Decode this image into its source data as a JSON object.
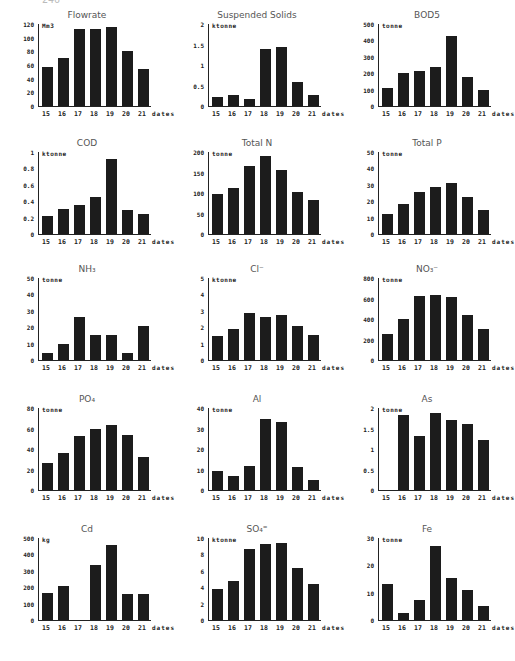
{
  "page_number": "246",
  "chart_data": [
    {
      "type": "bar",
      "title": "Flowrate",
      "unit": "Mm3",
      "xlabel": "dates",
      "categories": [
        "15",
        "16",
        "17",
        "18",
        "19",
        "20",
        "21"
      ],
      "values": [
        57,
        70,
        112,
        113,
        115,
        81,
        54
      ],
      "yticks": [
        "0",
        "20",
        "40",
        "60",
        "80",
        "100",
        "120"
      ],
      "ylim": [
        0,
        120
      ]
    },
    {
      "type": "bar",
      "title": "Suspended Solids",
      "unit": "ktonne",
      "xlabel": "dates",
      "categories": [
        "15",
        "16",
        "17",
        "18",
        "19",
        "20",
        "21"
      ],
      "values": [
        0.22,
        0.28,
        0.17,
        1.4,
        1.45,
        0.58,
        0.26
      ],
      "yticks": [
        "0",
        "0.5",
        "1",
        "1.5",
        "2"
      ],
      "ylim": [
        0,
        2
      ]
    },
    {
      "type": "bar",
      "title": "BOD5",
      "unit": "tonne",
      "xlabel": "dates",
      "categories": [
        "15",
        "16",
        "17",
        "18",
        "19",
        "20",
        "21"
      ],
      "values": [
        110,
        200,
        215,
        240,
        425,
        175,
        100
      ],
      "yticks": [
        "0",
        "100",
        "200",
        "300",
        "400",
        "500"
      ],
      "ylim": [
        0,
        500
      ]
    },
    {
      "type": "bar",
      "title": "COD",
      "unit": "ktonne",
      "xlabel": "dates",
      "categories": [
        "15",
        "16",
        "17",
        "18",
        "19",
        "20",
        "21"
      ],
      "values": [
        0.22,
        0.3,
        0.35,
        0.45,
        0.92,
        0.29,
        0.25
      ],
      "yticks": [
        "0",
        "0.2",
        "0.4",
        "0.6",
        "0.8",
        "1"
      ],
      "ylim": [
        0,
        1
      ]
    },
    {
      "type": "bar",
      "title": "Total N",
      "unit": "tonne",
      "xlabel": "dates",
      "categories": [
        "15",
        "16",
        "17",
        "18",
        "19",
        "20",
        "21"
      ],
      "values": [
        97,
        113,
        165,
        190,
        155,
        102,
        82
      ],
      "yticks": [
        "0",
        "50",
        "100",
        "150",
        "200"
      ],
      "ylim": [
        0,
        200
      ]
    },
    {
      "type": "bar",
      "title": "Total P",
      "unit": "tonne",
      "xlabel": "dates",
      "categories": [
        "15",
        "16",
        "17",
        "18",
        "19",
        "20",
        "21"
      ],
      "values": [
        12.5,
        18,
        25.5,
        28.5,
        31,
        22.5,
        14.5
      ],
      "yticks": [
        "0",
        "10",
        "20",
        "30",
        "40",
        "50"
      ],
      "ylim": [
        0,
        50
      ]
    },
    {
      "type": "bar",
      "title": "NH₃",
      "unit": "tonne",
      "xlabel": "dates",
      "categories": [
        "15",
        "16",
        "17",
        "18",
        "19",
        "20",
        "21"
      ],
      "values": [
        4,
        10,
        26,
        15,
        15,
        4.5,
        21
      ],
      "yticks": [
        "0",
        "10",
        "20",
        "30",
        "40",
        "50"
      ],
      "ylim": [
        0,
        50
      ]
    },
    {
      "type": "bar",
      "title": "Cl⁻",
      "unit": "ktonne",
      "xlabel": "dates",
      "categories": [
        "15",
        "16",
        "17",
        "18",
        "19",
        "20",
        "21"
      ],
      "values": [
        1.45,
        1.9,
        2.85,
        2.65,
        2.75,
        2.1,
        1.5
      ],
      "yticks": [
        "0",
        "1",
        "2",
        "3",
        "4",
        "5"
      ],
      "ylim": [
        0,
        5
      ]
    },
    {
      "type": "bar",
      "title": "NO₃⁻",
      "unit": "tonne",
      "xlabel": "dates",
      "categories": [
        "15",
        "16",
        "17",
        "18",
        "19",
        "20",
        "21"
      ],
      "values": [
        255,
        400,
        620,
        630,
        610,
        440,
        305
      ],
      "yticks": [
        "0",
        "200",
        "400",
        "600",
        "800"
      ],
      "ylim": [
        0,
        800
      ]
    },
    {
      "type": "bar",
      "title": "PO₄",
      "unit": "tonne",
      "xlabel": "dates",
      "categories": [
        "15",
        "16",
        "17",
        "18",
        "19",
        "20",
        "21"
      ],
      "values": [
        26,
        36,
        53,
        60,
        63,
        54,
        32
      ],
      "yticks": [
        "0",
        "20",
        "40",
        "60",
        "80"
      ],
      "ylim": [
        0,
        80
      ]
    },
    {
      "type": "bar",
      "title": "Al",
      "unit": "tonne",
      "xlabel": "dates",
      "categories": [
        "15",
        "16",
        "17",
        "18",
        "19",
        "20",
        "21"
      ],
      "values": [
        9.5,
        7,
        11.5,
        34.5,
        33,
        11,
        5
      ],
      "yticks": [
        "0",
        "10",
        "20",
        "30",
        "40"
      ],
      "ylim": [
        0,
        40
      ]
    },
    {
      "type": "bar",
      "title": "As",
      "unit": "tonne",
      "xlabel": "dates",
      "categories": [
        "15",
        "16",
        "17",
        "18",
        "19",
        "20",
        "21"
      ],
      "values": [
        0,
        1.82,
        1.32,
        1.88,
        1.7,
        1.6,
        1.22
      ],
      "yticks": [
        "0",
        "0.5",
        "1",
        "1.5",
        "2"
      ],
      "ylim": [
        0,
        2
      ]
    },
    {
      "type": "bar",
      "title": "Cd",
      "unit": "kg",
      "xlabel": "dates",
      "categories": [
        "15",
        "16",
        "17",
        "18",
        "19",
        "20",
        "21"
      ],
      "values": [
        165,
        210,
        0,
        335,
        460,
        160,
        160
      ],
      "yticks": [
        "0",
        "100",
        "200",
        "300",
        "400",
        "500"
      ],
      "ylim": [
        0,
        500
      ]
    },
    {
      "type": "bar",
      "title": "SO₄⁼",
      "unit": "ktonne",
      "xlabel": "dates",
      "categories": [
        "15",
        "16",
        "17",
        "18",
        "19",
        "20",
        "21"
      ],
      "values": [
        3.8,
        4.7,
        8.6,
        9.3,
        9.4,
        6.4,
        4.4
      ],
      "yticks": [
        "0",
        "2",
        "4",
        "6",
        "8",
        "10"
      ],
      "ylim": [
        0,
        10
      ]
    },
    {
      "type": "bar",
      "title": "Fe",
      "unit": "tonne",
      "xlabel": "dates",
      "categories": [
        "15",
        "16",
        "17",
        "18",
        "19",
        "20",
        "21"
      ],
      "values": [
        13,
        2.5,
        7.5,
        27,
        15.5,
        11,
        5
      ],
      "yticks": [
        "0",
        "10",
        "20",
        "30"
      ],
      "ylim": [
        0,
        30
      ]
    }
  ]
}
